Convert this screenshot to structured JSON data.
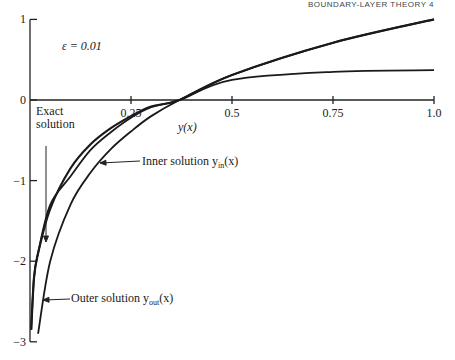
{
  "header": {
    "running_title": "BOUNDARY-LAYER THEORY  4"
  },
  "annotations": {
    "epsilon": "ε = 0.01",
    "exact_line1": "Exact",
    "exact_line2": "solution",
    "inner": "Inner solution y",
    "inner_sub": "in",
    "inner_tail": "(x)",
    "outer": "Outer solution y",
    "outer_sub": "out",
    "outer_tail": "(x)",
    "curve_label": "y(x)"
  },
  "chart_data": {
    "type": "line",
    "title": "",
    "xlabel": "",
    "ylabel": "",
    "curve_label": "y(x)",
    "parameter": "ε = 0.01",
    "xlim": [
      0,
      1.0
    ],
    "ylim": [
      -3,
      1
    ],
    "x_ticks": [
      "0.25",
      "0.5",
      "0.75",
      "1.0"
    ],
    "y_ticks": [
      "1",
      "0",
      "-1",
      "-2",
      "-3"
    ],
    "grid": false,
    "legend": "inline annotations",
    "series": [
      {
        "name": "Exact solution",
        "x": [
          0.003,
          0.01,
          0.02,
          0.05,
          0.1,
          0.15,
          0.2,
          0.25,
          0.3,
          0.37,
          0.5,
          0.75,
          1.0
        ],
        "y": [
          -2.85,
          -2.2,
          -1.9,
          -1.35,
          -0.85,
          -0.55,
          -0.35,
          -0.2,
          -0.08,
          0.0,
          0.31,
          0.71,
          1.0
        ]
      },
      {
        "name": "Outer solution y_out(x)",
        "x": [
          0.02,
          0.05,
          0.1,
          0.15,
          0.2,
          0.25,
          0.3,
          0.37,
          0.5,
          0.75,
          1.0
        ],
        "y": [
          -2.9,
          -2.0,
          -1.3,
          -0.9,
          -0.61,
          -0.39,
          -0.2,
          0.0,
          0.31,
          0.71,
          1.0
        ]
      },
      {
        "name": "Inner solution y_in(x)",
        "x": [
          0.003,
          0.01,
          0.02,
          0.05,
          0.1,
          0.15,
          0.2,
          0.25,
          0.3,
          0.37,
          0.5,
          0.75,
          1.0
        ],
        "y": [
          -2.85,
          -2.2,
          -1.9,
          -1.3,
          -0.95,
          -0.62,
          -0.4,
          -0.22,
          -0.09,
          0.0,
          0.25,
          0.35,
          0.37
        ]
      }
    ]
  }
}
